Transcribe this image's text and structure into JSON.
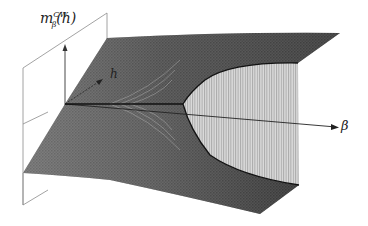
{
  "figure": {
    "type": "3d-surface",
    "labels": {
      "vertical_axis_main": "m",
      "vertical_axis_sub": "β",
      "vertical_axis_sup": "CW",
      "vertical_axis_arg": "(h)",
      "h_axis": "h",
      "beta_axis": "β"
    },
    "colors": {
      "upper_sheet": "#3a3a3a",
      "lower_sheet": "#383838",
      "mesh": "#6a6a6a",
      "jump_sheet": "#cfcfcf",
      "jump_sheet_stripes": "#9a9a9a",
      "axes": "#333333",
      "plane": "#888888"
    }
  }
}
